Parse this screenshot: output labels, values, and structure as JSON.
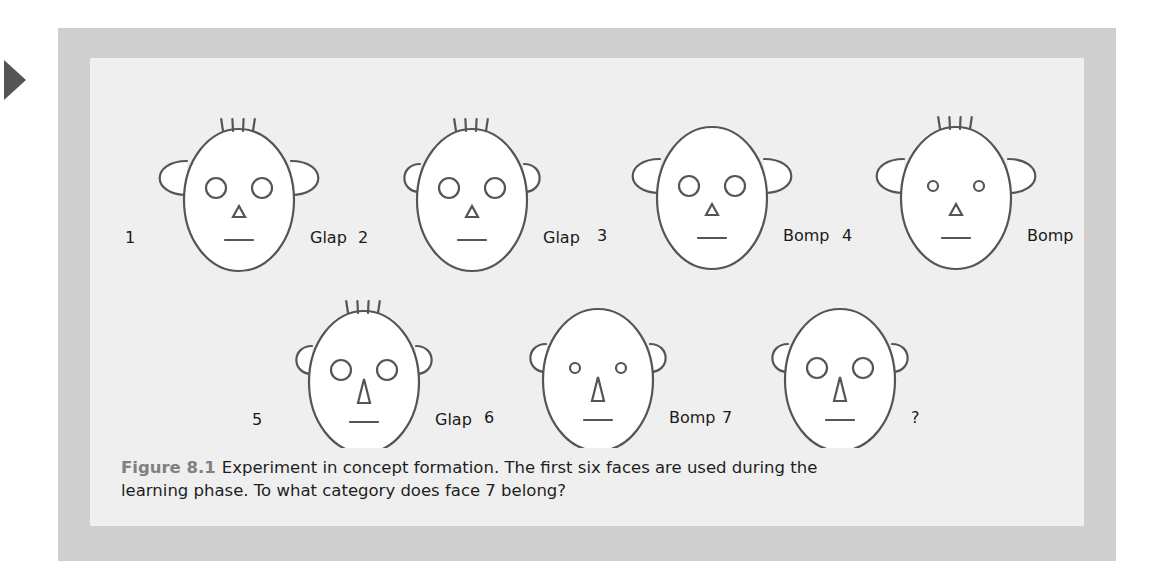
{
  "marker": {
    "icon": "right-triangle-arrow-icon",
    "color": "#555555"
  },
  "figure": {
    "frame_color": "#cfcfcf",
    "panel_color": "#efefef",
    "stroke_color": "#555555",
    "caption": {
      "label": "Figure 8.1",
      "line1": "Experiment in concept formation. The first six faces are used during the",
      "line2": "learning phase. To what category does face 7 belong?"
    },
    "faces": [
      {
        "number": "1",
        "category": "Glap",
        "hair": true,
        "eye_size": "large",
        "nose": "short",
        "ears": "large",
        "cx": 149,
        "cy": 142,
        "num_x": 35,
        "cat_x": 180
      },
      {
        "number": "2",
        "category": "Glap",
        "hair": true,
        "eye_size": "large",
        "nose": "short",
        "ears": "small",
        "cx": 382,
        "cy": 142,
        "num_x": 268,
        "cat_x": 418
      },
      {
        "number": "3",
        "category": "Bomp",
        "hair": false,
        "eye_size": "large",
        "nose": "short",
        "ears": "large",
        "cx": 622,
        "cy": 140,
        "num_x": 507,
        "cat_x": 657
      },
      {
        "number": "4",
        "category": "Bomp",
        "hair": true,
        "eye_size": "small",
        "nose": "short",
        "ears": "large",
        "cx": 866,
        "cy": 140,
        "num_x": 752,
        "cat_x": 903
      },
      {
        "number": "5",
        "category": "Glap",
        "hair": true,
        "eye_size": "large",
        "nose": "long",
        "ears": "small",
        "cx": 274,
        "cy": 324,
        "num_x": 162,
        "cat_x": 310
      },
      {
        "number": "6",
        "category": "Bomp",
        "hair": false,
        "eye_size": "small",
        "nose": "long",
        "ears": "small",
        "cx": 508,
        "cy": 322,
        "num_x": 394,
        "cat_x": 543
      },
      {
        "number": "7",
        "category": "?",
        "hair": false,
        "eye_size": "large",
        "nose": "long",
        "ears": "small",
        "cx": 750,
        "cy": 322,
        "num_x": 632,
        "cat_x": 790
      }
    ]
  }
}
